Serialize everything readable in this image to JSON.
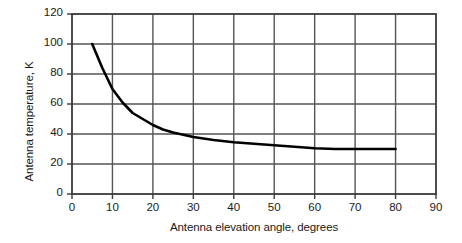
{
  "chart_data": {
    "type": "line",
    "title": "",
    "xlabel": "Antenna elevation angle, degrees",
    "ylabel": "Antenna temperature, K",
    "xlim": [
      0,
      90
    ],
    "ylim": [
      0,
      120
    ],
    "xticks": [
      "0",
      "10",
      "20",
      "30",
      "40",
      "50",
      "60",
      "70",
      "80",
      "90"
    ],
    "yticks": [
      "0",
      "20",
      "40",
      "60",
      "80",
      "100",
      "120"
    ],
    "grid": true,
    "legend": "none",
    "series": [
      {
        "name": "Antenna temperature",
        "color": "#000000",
        "x": [
          5,
          7.5,
          10,
          12.5,
          15,
          17.5,
          20,
          22.5,
          25,
          27.5,
          30,
          35,
          40,
          45,
          50,
          55,
          60,
          65,
          70,
          75,
          80
        ],
        "values": [
          100,
          84,
          70,
          61,
          54,
          50,
          46,
          43,
          41,
          39.5,
          38,
          36,
          34.5,
          33.5,
          32.5,
          31.5,
          30.5,
          30,
          30,
          30,
          30
        ]
      }
    ]
  },
  "axis": {
    "grid_color": "#555555",
    "axis_color": "#3a3a3a",
    "curve_color": "#000000",
    "background": "#ffffff"
  }
}
